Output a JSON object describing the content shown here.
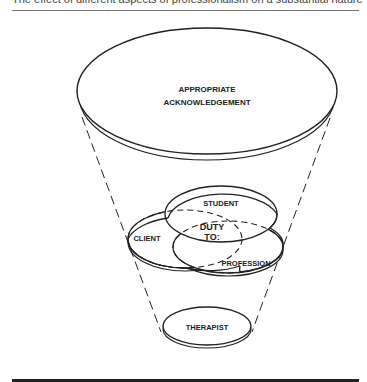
{
  "caption": "The effect of different aspects of professionalism on a substantial nature",
  "diagram": {
    "top_label_line1": "APPROPRIATE",
    "top_label_line2": "ACKNOWLEDGEMENT",
    "student": "STUDENT",
    "client": "CLIENT",
    "profession": "PROFESSION",
    "duty_line1": "DUTY",
    "duty_line2": "TO:",
    "bottom_label": "THERAPIST"
  },
  "colors": {
    "stroke": "#222222",
    "background": "#ffffff"
  }
}
